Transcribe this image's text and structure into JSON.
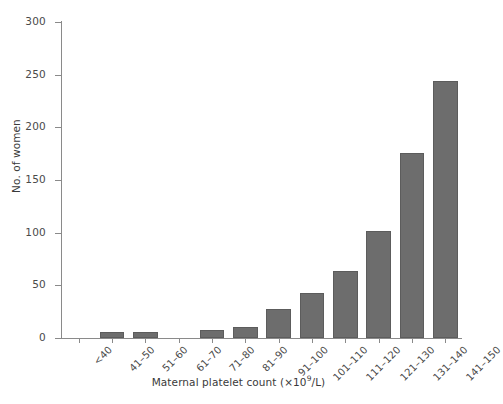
{
  "chart_data": {
    "type": "bar",
    "title": "",
    "xlabel": "Maternal platelet count (×10⁹/L)",
    "ylabel": "No. of women",
    "categories": [
      "<40",
      "41–50",
      "51–60",
      "61–70",
      "71–80",
      "81–90",
      "91–100",
      "101–110",
      "111–120",
      "121–130",
      "131–140",
      "141–150"
    ],
    "values": [
      0,
      6,
      6,
      0,
      8,
      10,
      28,
      43,
      64,
      102,
      176,
      244
    ],
    "ylim": [
      0,
      300
    ],
    "yticks": [
      0,
      50,
      100,
      150,
      200,
      250,
      300
    ],
    "ytick_labels": [
      "0",
      "50",
      "100",
      "150",
      "200",
      "250",
      "300"
    ],
    "grid": false,
    "legend": false,
    "bar_color": "#6d6d6d",
    "bar_edge_color": "#5c5c5c",
    "axis_color": "#8a8a8a",
    "background_color": "#ffffff"
  },
  "axis_titles": {
    "x_main": "Maternal platelet count (×10",
    "x_sup": "9",
    "x_tail": "/L)",
    "y": "No. of women"
  }
}
